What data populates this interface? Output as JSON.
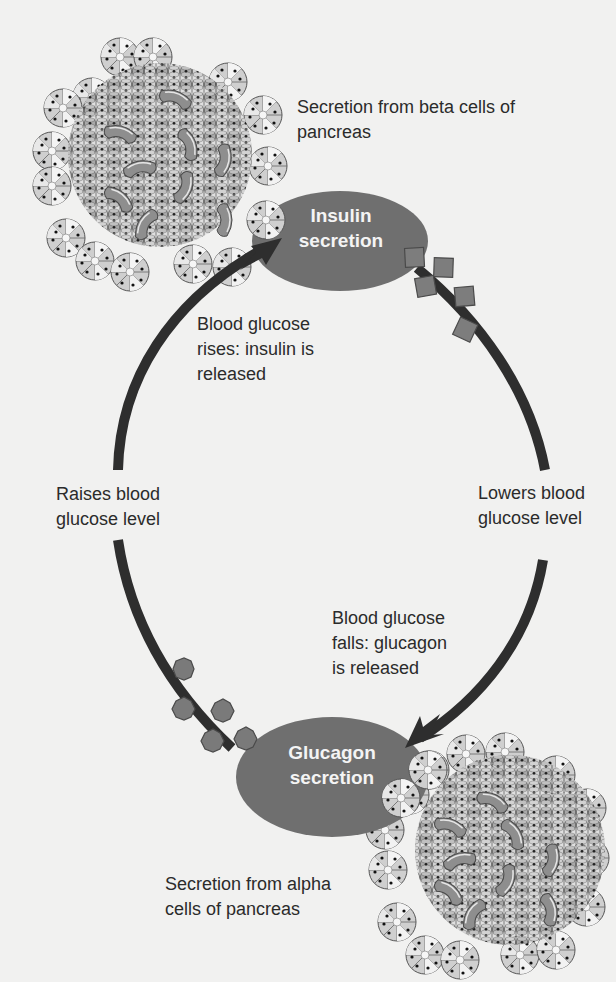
{
  "figure": {
    "cut_title": "gg",
    "colors": {
      "background": "#f1f1f0",
      "node_fill": "#6f6f6f",
      "arrow": "#2e2e2e",
      "hormone_fill": "#7a7a7a",
      "text": "#2b2b2b",
      "node_text": "#f4f4f4"
    },
    "nodes": [
      {
        "id": "insulin",
        "label": "Insulin\nsecretion"
      },
      {
        "id": "glucagon",
        "label": "Glucagon\nsecretion"
      }
    ],
    "labels": {
      "beta_source": "Secretion from beta cells of\npancreas",
      "alpha_source": "Secretion from alpha\ncells of pancreas",
      "insulin_trigger": "Blood glucose\nrises: insulin is\nreleased",
      "glucagon_trigger": "Blood glucose\nfalls: glucagon\nis released",
      "raises": "Raises blood\nglucose level",
      "lowers": "Lowers blood\nglucose level"
    },
    "edges": [
      {
        "from": "glucagon",
        "to": "insulin",
        "side": "left",
        "label": "Raises blood glucose level",
        "marker": "octagon"
      },
      {
        "from": "insulin",
        "to": "glucagon",
        "side": "right",
        "label": "Lowers blood glucose level",
        "marker": "square"
      }
    ],
    "clusters": [
      {
        "name": "beta-cell-islet",
        "position": "top-left"
      },
      {
        "name": "alpha-cell-islet",
        "position": "bottom-right"
      }
    ]
  }
}
